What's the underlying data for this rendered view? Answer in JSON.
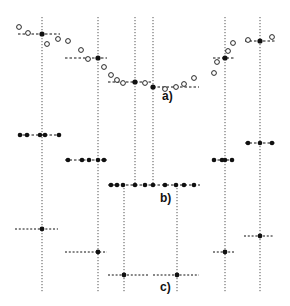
{
  "figure": {
    "panels": [
      {
        "id": "a",
        "label": "a)",
        "label_pos": [
          162,
          96
        ]
      },
      {
        "id": "b",
        "label": "b)",
        "label_pos": [
          160,
          198
        ]
      },
      {
        "id": "c",
        "label": "c)",
        "label_pos": [
          160,
          287
        ]
      }
    ],
    "colors": {
      "ink": "#111111",
      "guide": "#555555",
      "background": "#ffffff"
    },
    "vertical_guides": [
      {
        "x": 42,
        "y1": 17,
        "y2": 293
      },
      {
        "x": 98,
        "y1": 17,
        "y2": 293
      },
      {
        "x": 135,
        "y1": 17,
        "y2": 185
      },
      {
        "x": 153,
        "y1": 17,
        "y2": 185
      },
      {
        "x": 225,
        "y1": 17,
        "y2": 293
      },
      {
        "x": 260,
        "y1": 17,
        "y2": 293
      },
      {
        "x": 124,
        "y1": 185,
        "y2": 293
      },
      {
        "x": 177,
        "y1": 185,
        "y2": 293
      }
    ],
    "panel_a": {
      "open_circles": [
        [
          19,
          27
        ],
        [
          28,
          33
        ],
        [
          47,
          44
        ],
        [
          58,
          39
        ],
        [
          68,
          41
        ],
        [
          81,
          50
        ],
        [
          88,
          59
        ],
        [
          104,
          67
        ],
        [
          111,
          75
        ],
        [
          117,
          80
        ],
        [
          123,
          83
        ],
        [
          145,
          83
        ],
        [
          165,
          89
        ],
        [
          176,
          87
        ],
        [
          184,
          84
        ],
        [
          194,
          78
        ],
        [
          214,
          73
        ],
        [
          217,
          62
        ],
        [
          228,
          51
        ],
        [
          233,
          43
        ],
        [
          248,
          40
        ],
        [
          272,
          37
        ]
      ],
      "segments": [
        {
          "x1": 18,
          "x2": 60,
          "y": 34,
          "cx": 42
        },
        {
          "x1": 65,
          "x2": 107,
          "y": 58,
          "cx": 98
        },
        {
          "x1": 108,
          "x2": 152,
          "y": 82,
          "cx": 135
        },
        {
          "x1": 153,
          "x2": 199,
          "y": 87,
          "cx": 153
        },
        {
          "x1": 213,
          "x2": 235,
          "y": 58,
          "cx": 225
        },
        {
          "x1": 245,
          "x2": 275,
          "y": 41,
          "cx": 260
        }
      ]
    },
    "panel_b": {
      "rows": [
        {
          "x1": 18,
          "x2": 60,
          "y": 135,
          "dots": [
            20,
            27,
            40,
            45,
            59
          ]
        },
        {
          "x1": 65,
          "x2": 107,
          "y": 160,
          "dots": [
            68,
            82,
            89,
            98,
            104
          ]
        },
        {
          "x1": 108,
          "x2": 200,
          "y": 185,
          "dots": [
            111,
            117,
            123,
            135,
            145,
            153,
            165,
            176,
            184,
            194
          ]
        },
        {
          "x1": 213,
          "x2": 235,
          "y": 160,
          "dots": [
            214,
            222,
            225,
            232
          ]
        },
        {
          "x1": 245,
          "x2": 275,
          "y": 143,
          "dots": [
            248,
            260,
            272
          ]
        }
      ]
    },
    "panel_c": {
      "segments": [
        {
          "x1": 15,
          "x2": 58,
          "y": 229,
          "cx": 42
        },
        {
          "x1": 65,
          "x2": 107,
          "y": 252,
          "cx": 98
        },
        {
          "x1": 108,
          "x2": 148,
          "y": 275,
          "cx": 124
        },
        {
          "x1": 153,
          "x2": 199,
          "y": 275,
          "cx": 177
        },
        {
          "x1": 213,
          "x2": 234,
          "y": 252,
          "cx": 225
        },
        {
          "x1": 244,
          "x2": 274,
          "y": 236,
          "cx": 260
        }
      ]
    }
  }
}
